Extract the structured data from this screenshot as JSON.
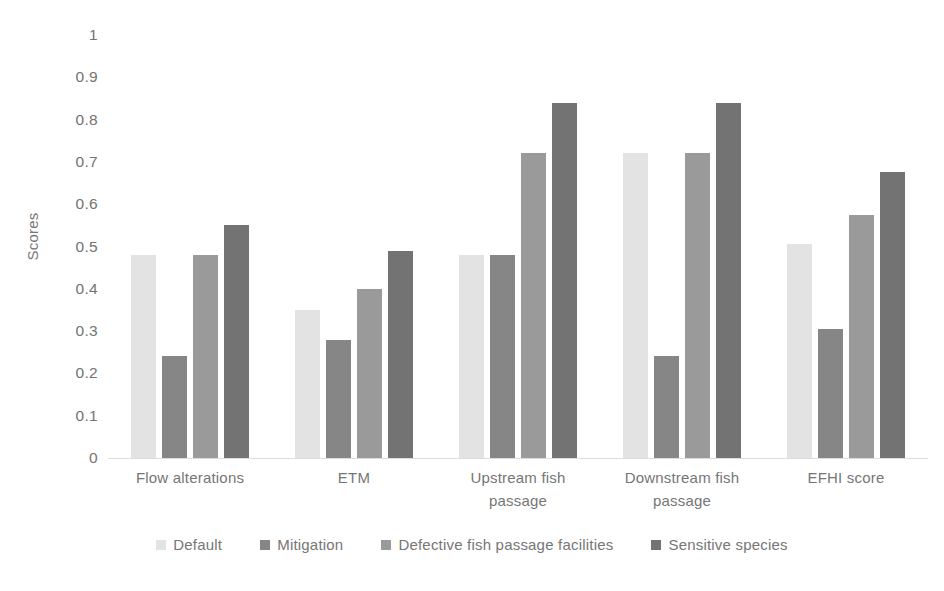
{
  "chart_data": {
    "type": "bar",
    "title": "",
    "subtitle": "",
    "xlabel": "",
    "ylabel": "Scores",
    "ylim": [
      0,
      1
    ],
    "ytick_labels": [
      "1",
      "0.9",
      "0.8",
      "0.7",
      "0.6",
      "0.5",
      "0.4",
      "0.3",
      "0.2",
      "0.1",
      "0"
    ],
    "ytick_values": [
      1,
      0.9,
      0.8,
      0.7,
      0.6,
      0.5,
      0.4,
      0.3,
      0.2,
      0.1,
      0
    ],
    "grid": false,
    "legend_position": "bottom",
    "categories": [
      "Flow alterations",
      "ETM",
      "Upstream fish passage",
      "Downstream fish passage",
      "EFHI score"
    ],
    "category_lines": [
      [
        "Flow alterations"
      ],
      [
        "ETM"
      ],
      [
        "Upstream fish",
        "passage"
      ],
      [
        "Downstream fish",
        "passage"
      ],
      [
        "EFHI score"
      ]
    ],
    "series": [
      {
        "name": "Default",
        "color": "#e3e3e3",
        "values": [
          0.48,
          0.35,
          0.48,
          0.72,
          0.505
        ]
      },
      {
        "name": "Mitigation",
        "color": "#868686",
        "values": [
          0.24,
          0.28,
          0.48,
          0.24,
          0.305
        ]
      },
      {
        "name": "Defective fish passage facilities",
        "color": "#9a9a9a",
        "values": [
          0.48,
          0.4,
          0.72,
          0.72,
          0.575
        ]
      },
      {
        "name": "Sensitive species",
        "color": "#737373",
        "values": [
          0.55,
          0.49,
          0.84,
          0.84,
          0.675
        ]
      }
    ]
  }
}
